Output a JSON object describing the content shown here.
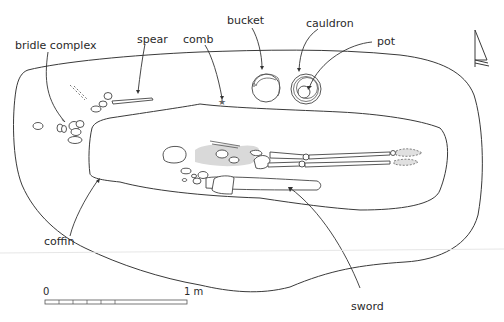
{
  "labels": {
    "bridle_complex": "bridle complex",
    "spear": "spear",
    "comb": "comb",
    "bucket": "bucket",
    "cauldron": "cauldron",
    "pot": "pot",
    "coffin": "coffin",
    "sword": "sword"
  },
  "scale_bar": {
    "start_label": "0",
    "end_label": "1 m"
  },
  "north_arrow": {
    "icon": "north-arrow-icon"
  },
  "colors": {
    "line": "#3a3a3a",
    "shading": "#d9d9d9",
    "background": "#ffffff"
  }
}
